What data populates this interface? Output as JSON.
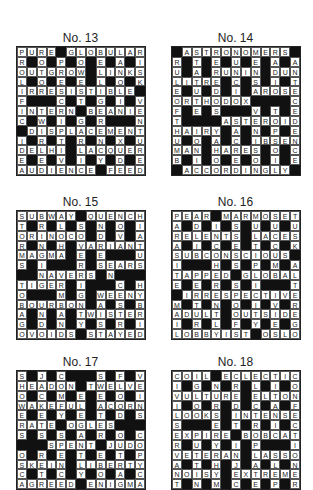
{
  "puzzles": [
    {
      "id": "p13",
      "title": "No. 13",
      "rows": [
        "PURE#GLOBULAR",
        "R#O#P#O#E#A#I",
        "OUTGROW#LINKS",
        "L#O#E#E#L#O#K",
        "IRRESISTIBLE#",
        "F###C#T#G#I#V",
        "INTERN#BEANIE",
        "C#W#I#G#R###N",
        "#DISPLACEMENT",
        "I#R#T#R#N#X#U",
        "DELHI#LACQUER",
        "E#E#V#I#Y#D#E",
        "AUDIENCE#FEED"
      ]
    },
    {
      "id": "p14",
      "title": "No. 14",
      "rows": [
        "#ASTRONOMERS#",
        "R#T#E#U#E#A#A",
        "U#A#RUNIN#DUN",
        "LITRE#C#S#I#T",
        "E#U#D#I#AROSE",
        "ORTHODOX####C",
        "F#E#S###V#T#E",
        "T####ASTEROID",
        "HAIRY#A#N#P#E",
        "U#O#A#C#IBSEN",
        "MAN#HARES#O#C",
        "B#I#O#E#O#I#E",
        "#ACCORDINGLY#"
      ]
    },
    {
      "id": "p15",
      "title": "No. 15",
      "rows": [
        "SUBWAY#QUENCH",
        "T#R#L#S#N#O#I",
        "ORINOCO#D#V#A",
        "R#N#H#VARIANT",
        "MAGMA#E#E###U",
        "S#I###R#SEARS",
        "##NAVERS#N###",
        "TIGER#I###C#H",
        "O###M#G#WEENY",
        "BOURBON#A#S#B",
        "A#N#A#TWISTER",
        "G#D#N#Y#S#R#I",
        "OVOIDS#STAYED"
      ]
    },
    {
      "id": "p16",
      "title": "No. 16",
      "rows": [
        "PEAR#MARMOSET",
        "A#D#I#S#U#U#U",
        "RELENTS#LACES",
        "A#I#C#E#T#C#K",
        "SUBCONSCIOUS#",
        "I###H#S#P#M#A",
        "TAPPED#GLOBAL",
        "E#E#R#S#I###T",
        "#IRRESPECTIVE",
        "M#T#N#O#I#V#R",
        "ADULT#OUTSIDE",
        "I#R#L#F#Y#E#G",
        "LOBBYIST#OSLO"
      ]
    },
    {
      "id": "p17",
      "title": "No. 17",
      "rows": [
        "S#J#C###S#F#V",
        "HEADON#TWELVE",
        "O#C#M#E#E#O#I",
        "WAKEFUL#ACORN",
        "E#E#Y#E#T#D#S",
        "RATE#OGLES###",
        "S#S#S#A#R#O#C",
        "###SPENT#JUDO",
        "O#R#E#T#E#T#P",
        "SKEIN#LIBERTY",
        "C#T#C#Y#O#A#C",
        "AGREED#ENIGMA"
      ]
    },
    {
      "id": "p18",
      "title": "No. 18",
      "rows": [
        "COIL#ECLECTIC",
        "I#G#N#R#L#I#O",
        "VULTURE#ELTON",
        "I#O#R#D#C#A#F",
        "LOOKS#INTENSE",
        "S###E#T#R#I#C",
        "EXPIRE#BOBCAT",
        "R#U#Y#I#P###I",
        "VETERAN#LASSO",
        "A#T#H#J#A#L#N",
        "NOISY#EXTREME",
        "T#N#M#C#E#P#R"
      ]
    }
  ]
}
